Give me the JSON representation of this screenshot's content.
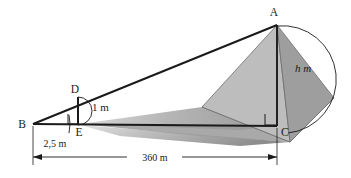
{
  "figure": {
    "type": "geometry-diagram",
    "width": 351,
    "height": 178,
    "background_color": "#ffffff",
    "line_color": "#1a1a1a",
    "points": {
      "A": {
        "label": "A",
        "x": 277,
        "y": 25,
        "role": "pyramid-apex"
      },
      "B": {
        "label": "B",
        "x": 33,
        "y": 124,
        "role": "observer-ground-point"
      },
      "C": {
        "label": "C",
        "x": 277,
        "y": 126,
        "role": "pyramid-base-center"
      },
      "D": {
        "label": "D",
        "x": 78,
        "y": 97,
        "role": "stick-top"
      },
      "E": {
        "label": "E",
        "x": 78,
        "y": 124,
        "role": "stick-base"
      }
    },
    "measurements": [
      {
        "name": "pyramid-height",
        "label": "h m",
        "symbol": "h",
        "unit": "m",
        "value": null,
        "between": [
          "A",
          "C"
        ]
      },
      {
        "name": "stick-height",
        "label": "1 m",
        "value": "1",
        "unit": "m",
        "between": [
          "D",
          "E"
        ]
      },
      {
        "name": "stick-distance",
        "label": "2,5 m",
        "value": "2,5",
        "unit": "m",
        "between": [
          "B",
          "E"
        ]
      },
      {
        "name": "base-distance",
        "label": "360 m",
        "value": "360",
        "unit": "m",
        "between": [
          "B",
          "C"
        ]
      }
    ],
    "colors": {
      "face_left": "#b9b9b9",
      "face_right": "#9e9e9e",
      "base_far": "#a8a8a8",
      "base_front": "#8f8f8f",
      "shadow_dark": "#8c8c8c",
      "shadow_light": "#d9d9d9",
      "outline": "#5a5a5a",
      "stroke": "#1a1a1a"
    },
    "right_angle_marks": [
      {
        "name": "right-angle-at-E",
        "at": "E"
      },
      {
        "name": "right-angle-at-C",
        "at": "C"
      }
    ],
    "angle_arcs": [
      {
        "name": "angle-arc-at-B",
        "at": "B"
      },
      {
        "name": "angle-arc-at-D",
        "at": "D"
      },
      {
        "name": "angle-arc-at-A",
        "at": "A"
      }
    ]
  }
}
